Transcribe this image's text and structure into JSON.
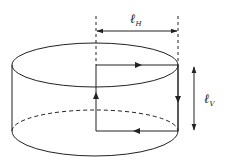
{
  "diagram": {
    "labels": {
      "horizontal_length": {
        "main": "ℓ",
        "subscript": "H"
      },
      "vertical_length": {
        "main": "ℓ",
        "subscript": "V"
      }
    },
    "loop_direction": [
      "right along top edge",
      "down along outer side",
      "left along bottom edge",
      "up along inner side"
    ],
    "colors": {
      "stroke": "#222222",
      "background": "#ffffff"
    }
  }
}
